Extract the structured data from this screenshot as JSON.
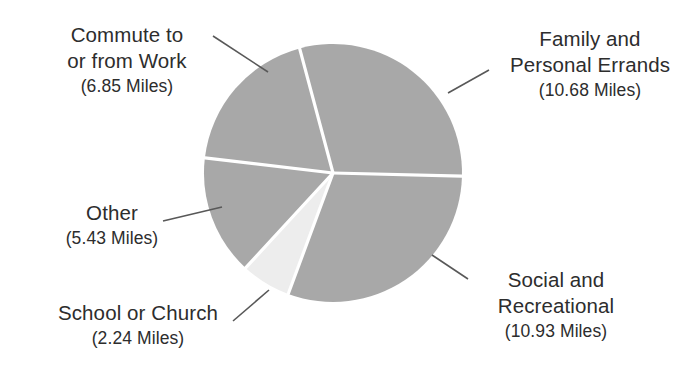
{
  "chart_data": {
    "type": "pie",
    "title": "",
    "unit": "Miles",
    "total": 36.13,
    "start_angle_deg": -15,
    "direction": "clockwise",
    "center": {
      "x": 333,
      "y": 173
    },
    "radius": 129,
    "slice_gap_color": "#ffffff",
    "categories": [
      "Family and Personal Errands",
      "Social and Recreational",
      "School or Church",
      "Other",
      "Commute to or from Work"
    ],
    "values": [
      10.68,
      10.93,
      2.24,
      5.43,
      6.85
    ],
    "colors": [
      "#a8a8a8",
      "#a8a8a8",
      "#ededed",
      "#a8a8a8",
      "#a8a8a8"
    ],
    "legend_position": "callouts",
    "grid": false
  },
  "callouts": {
    "commute": {
      "label_line1": "Commute to",
      "label_line2": "or from Work",
      "value": "(6.85 Miles)"
    },
    "family": {
      "label_line1": "Family and",
      "label_line2": "Personal Errands",
      "value": "(10.68 Miles)"
    },
    "social": {
      "label_line1": "Social and",
      "label_line2": "Recreational",
      "value": "(10.93 Miles)"
    },
    "other": {
      "label_line1": "Other",
      "label_line2": "",
      "value": "(5.43 Miles)"
    },
    "school": {
      "label_line1": "School or Church",
      "label_line2": "",
      "value": "(2.24 Miles)"
    }
  }
}
